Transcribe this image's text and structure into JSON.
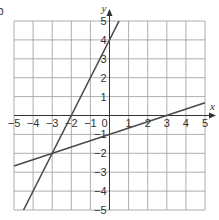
{
  "edge_glyph": "b",
  "chart_data": {
    "type": "line",
    "title": "",
    "xlabel": "x",
    "ylabel": "y",
    "xlim": [
      -5,
      5
    ],
    "ylim": [
      -5,
      5
    ],
    "grid": true,
    "x_ticks": [
      "-5",
      "-4",
      "-3",
      "-2",
      "-1",
      "0",
      "1",
      "2",
      "3",
      "4",
      "5"
    ],
    "y_ticks": [
      "5",
      "4",
      "3",
      "2",
      "1",
      "-1",
      "-2",
      "-3",
      "-4",
      "-5"
    ],
    "origin_label": "0",
    "series": [
      {
        "name": "steep line",
        "equation": "y = 2x + 4",
        "points": [
          [
            -4.5,
            -5
          ],
          [
            -3,
            -2
          ],
          [
            -2,
            0
          ],
          [
            0,
            4
          ],
          [
            0.5,
            5
          ]
        ]
      },
      {
        "name": "shallow line",
        "equation": "y = x/3 - 1",
        "points": [
          [
            -5,
            -2.67
          ],
          [
            -3,
            -2
          ],
          [
            0,
            -1
          ],
          [
            3,
            0
          ],
          [
            5,
            0.67
          ]
        ]
      }
    ],
    "intersection": [
      -3,
      -2
    ],
    "colors": {
      "grid": "#9a9a9a",
      "axis": "#333333",
      "line": "#4a4a4a"
    }
  }
}
